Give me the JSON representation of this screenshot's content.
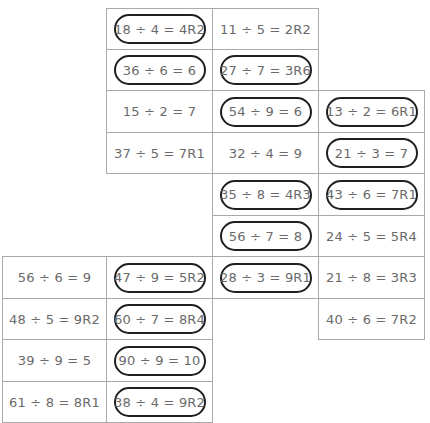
{
  "worksheet": {
    "layout": {
      "col_x": [
        2,
        106,
        212,
        318,
        424
      ],
      "row_y": [
        8,
        49,
        90,
        132,
        173,
        215,
        256,
        298,
        339,
        381,
        422
      ]
    },
    "cells": [
      {
        "row": 0,
        "col": 1,
        "text": "18 ÷ 4 = 4R2",
        "circled": true
      },
      {
        "row": 0,
        "col": 2,
        "text": "11 ÷ 5 = 2R2",
        "circled": false
      },
      {
        "row": 1,
        "col": 1,
        "text": "36 ÷ 6 = 6",
        "circled": true
      },
      {
        "row": 1,
        "col": 2,
        "text": "27 ÷ 7 = 3R6",
        "circled": true
      },
      {
        "row": 2,
        "col": 1,
        "text": "15 ÷ 2 = 7",
        "circled": false
      },
      {
        "row": 2,
        "col": 2,
        "text": "54 ÷ 9 = 6",
        "circled": true
      },
      {
        "row": 2,
        "col": 3,
        "text": "13 ÷ 2 = 6R1",
        "circled": true
      },
      {
        "row": 3,
        "col": 1,
        "text": "37 ÷ 5 = 7R1",
        "circled": false
      },
      {
        "row": 3,
        "col": 2,
        "text": "32 ÷ 4 = 9",
        "circled": false
      },
      {
        "row": 3,
        "col": 3,
        "text": "21 ÷ 3 = 7",
        "circled": true
      },
      {
        "row": 4,
        "col": 2,
        "text": "35 ÷ 8 = 4R3",
        "circled": true
      },
      {
        "row": 4,
        "col": 3,
        "text": "43 ÷ 6 = 7R1",
        "circled": true
      },
      {
        "row": 5,
        "col": 2,
        "text": "56 ÷ 7 = 8",
        "circled": true
      },
      {
        "row": 5,
        "col": 3,
        "text": "24 ÷ 5 = 5R4",
        "circled": false
      },
      {
        "row": 6,
        "col": 0,
        "text": "56 ÷ 6 = 9",
        "circled": false
      },
      {
        "row": 6,
        "col": 1,
        "text": "47 ÷ 9 = 5R2",
        "circled": true
      },
      {
        "row": 6,
        "col": 2,
        "text": "28 ÷ 3 = 9R1",
        "circled": true
      },
      {
        "row": 6,
        "col": 3,
        "text": "21 ÷ 8 = 3R3",
        "circled": false
      },
      {
        "row": 7,
        "col": 0,
        "text": "48 ÷ 5 = 9R2",
        "circled": false
      },
      {
        "row": 7,
        "col": 1,
        "text": "60 ÷ 7 = 8R4",
        "circled": true
      },
      {
        "row": 7,
        "col": 3,
        "text": "40 ÷ 6 = 7R2",
        "circled": false
      },
      {
        "row": 8,
        "col": 0,
        "text": "39 ÷ 9 = 5",
        "circled": false
      },
      {
        "row": 8,
        "col": 1,
        "text": "90 ÷ 9 = 10",
        "circled": true
      },
      {
        "row": 9,
        "col": 0,
        "text": "61 ÷ 8 = 8R1",
        "circled": false
      },
      {
        "row": 9,
        "col": 1,
        "text": "38 ÷ 4 = 9R2",
        "circled": true
      }
    ],
    "colors": {
      "grid_line": "#a9a9a9",
      "oval_stroke": "#1f1f1f",
      "text": "#6a6a6a"
    }
  }
}
